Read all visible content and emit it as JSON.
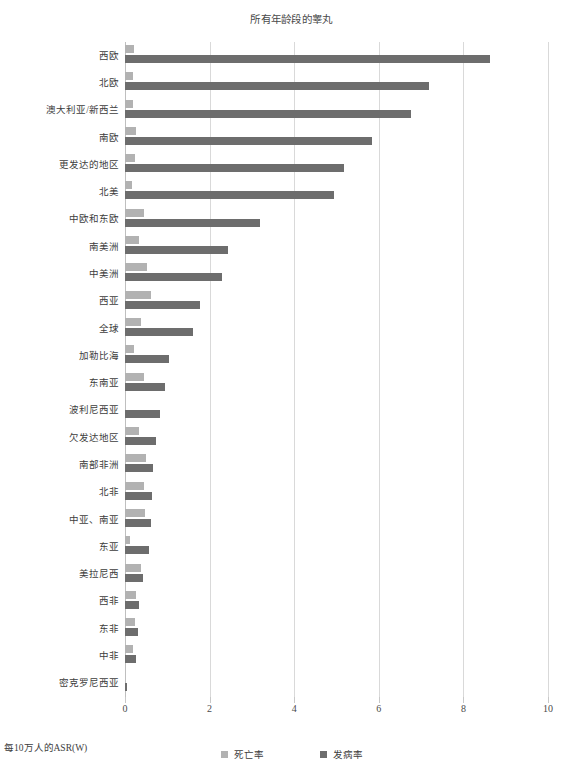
{
  "chart_data": {
    "type": "bar",
    "orientation": "horizontal",
    "title": "所有年龄段的睾丸",
    "xlabel": "每10万人的ASR(W)",
    "ylabel": "",
    "xlim": [
      0,
      10
    ],
    "xticks": [
      "0",
      "2",
      "4",
      "6",
      "8",
      "10"
    ],
    "xtick_values": [
      0,
      2,
      4,
      6,
      8,
      10
    ],
    "grid": true,
    "legend_position": "bottom-center",
    "categories": [
      "西欧",
      "北欧",
      "澳大利亚/新西兰",
      "南欧",
      "更发达的地区",
      "北美",
      "中欧和东欧",
      "南美洲",
      "中美洲",
      "西亚",
      "全球",
      "加勒比海",
      "东南亚",
      "波利尼西亚",
      "欠发达地区",
      "南部非洲",
      "北非",
      "中亚、南亚",
      "东亚",
      "美拉尼西",
      "西非",
      "东非",
      "中非",
      "密克罗尼西亚"
    ],
    "series": [
      {
        "name": "死亡率",
        "color": "#b2b2b2",
        "values": [
          0.21,
          0.19,
          0.2,
          0.27,
          0.24,
          0.17,
          0.44,
          0.34,
          0.53,
          0.62,
          0.38,
          0.22,
          0.44,
          0.0,
          0.34,
          0.5,
          0.46,
          0.47,
          0.11,
          0.37,
          0.27,
          0.24,
          0.2,
          0.0
        ]
      },
      {
        "name": "发病率",
        "color": "#6d6d6d",
        "values": [
          8.62,
          7.18,
          6.75,
          5.85,
          5.17,
          4.95,
          3.2,
          2.43,
          2.3,
          1.78,
          1.6,
          1.05,
          0.94,
          0.82,
          0.74,
          0.66,
          0.63,
          0.62,
          0.57,
          0.43,
          0.33,
          0.3,
          0.27,
          0.04
        ]
      }
    ]
  },
  "legend": {
    "items": [
      {
        "label": "死亡率",
        "swatch": "mortality"
      },
      {
        "label": "发病率",
        "swatch": "incidence"
      }
    ]
  }
}
